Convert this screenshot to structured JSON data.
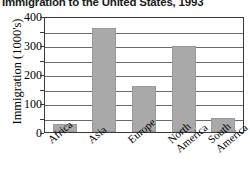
{
  "chart_data": {
    "type": "bar",
    "title": "Immigration to the United States, 1993",
    "xlabel": "",
    "ylabel": "Immigration (1000's)",
    "categories": [
      "Africa",
      "Asia",
      "Europe",
      "North America",
      "South America"
    ],
    "values": [
      27,
      358,
      158,
      297,
      48
    ],
    "ylim": [
      0,
      400
    ],
    "yticks": [
      0,
      100,
      200,
      300,
      400
    ],
    "ytick_labels": [
      "0",
      "100",
      "200",
      "300",
      "400"
    ],
    "minor_tick_step": 50,
    "gridlines": [
      50,
      100,
      150,
      200,
      250,
      300,
      350
    ],
    "grid": true,
    "legend": false,
    "bar_color": "#a9a9a9",
    "axis_color": "#3a3a3a",
    "grid_color": "#6b6b6b",
    "background": "#ffffff"
  }
}
